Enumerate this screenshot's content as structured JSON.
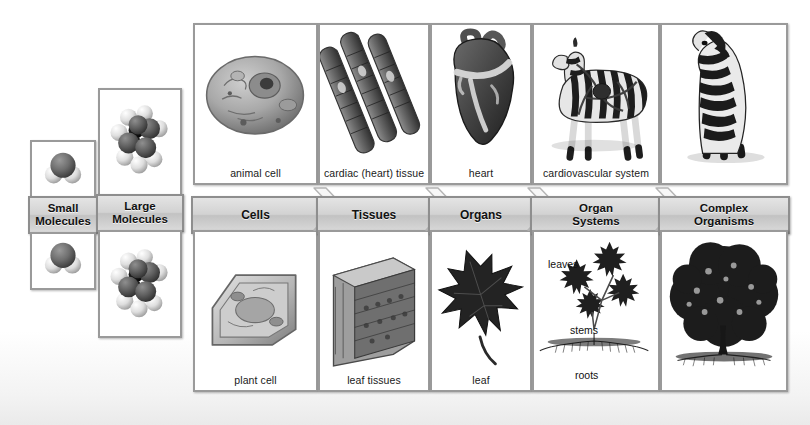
{
  "diagram": {
    "columns": [
      {
        "key": "small-molecules",
        "band_label": "Small\nMolecules",
        "band_label_line1": "Small",
        "band_label_line2": "Molecules",
        "top_caption": "",
        "bottom_caption": "",
        "top_art": "water-molecule-space-filling-model",
        "bottom_art": "water-molecule-space-filling-model"
      },
      {
        "key": "large-molecules",
        "band_label_line1": "Large",
        "band_label_line2": "Molecules",
        "top_caption": "",
        "bottom_caption": "",
        "top_art": "macromolecule-space-filling-model",
        "bottom_art": "macromolecule-space-filling-model"
      },
      {
        "key": "cells",
        "band_label_line1": "Cells",
        "band_label_line2": "",
        "top_caption": "animal cell",
        "bottom_caption": "plant cell",
        "top_art": "animal-cell-illustration",
        "bottom_art": "plant-cell-illustration"
      },
      {
        "key": "tissues",
        "band_label_line1": "Tissues",
        "band_label_line2": "",
        "top_caption": "cardiac (heart) tissue",
        "bottom_caption": "leaf tissues",
        "top_art": "cardiac-muscle-fibers-illustration",
        "bottom_art": "leaf-cross-section-illustration"
      },
      {
        "key": "organs",
        "band_label_line1": "Organs",
        "band_label_line2": "",
        "top_caption": "heart",
        "bottom_caption": "leaf",
        "top_art": "human-heart-illustration",
        "bottom_art": "maple-leaf-illustration"
      },
      {
        "key": "organ-systems",
        "band_label_line1": "Organ",
        "band_label_line2": "Systems",
        "top_caption": "cardiovascular system",
        "bottom_caption": "",
        "top_art": "zebra-with-cardiovascular-system-illustration",
        "bottom_art": "plant-shoot-and-root-system-illustration",
        "inline_labels": [
          {
            "text": "leaves",
            "x": 14,
            "y": 26
          },
          {
            "text": "stems",
            "x": 36,
            "y": 92
          },
          {
            "text": "roots",
            "x": 41,
            "y": 137
          }
        ]
      },
      {
        "key": "complex-organisms",
        "band_label_line1": "Complex",
        "band_label_line2": "Organisms",
        "top_caption": "",
        "bottom_caption": "",
        "top_art": "zebra-front-view-illustration",
        "bottom_art": "tree-illustration"
      }
    ],
    "arrows": [
      {
        "from": "cells",
        "to": "tissues"
      },
      {
        "from": "tissues",
        "to": "organs"
      },
      {
        "from": "organs",
        "to": "organ-systems"
      },
      {
        "from": "organ-systems",
        "to": "complex-organisms"
      }
    ],
    "colors": {
      "panel_border": "#9a9a9a",
      "band_fill": "#d2d2d2",
      "band_border": "#8e8e8e",
      "arrow_fill": "#f6f6f6",
      "text": "#111111",
      "background": "#ffffff"
    }
  }
}
